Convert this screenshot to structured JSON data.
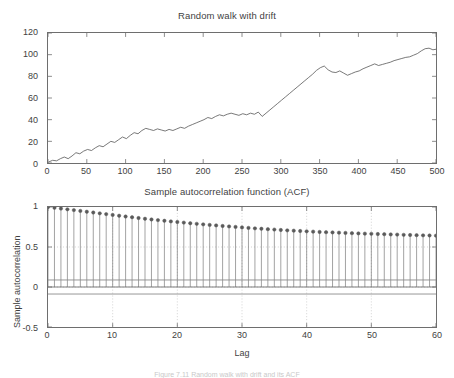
{
  "figure": {
    "caption": "Figure 7.11   Random walk with drift and its ACF"
  },
  "chart_data": [
    {
      "type": "line",
      "title": "Random walk with drift",
      "xlabel": "",
      "ylabel": "",
      "xlim": [
        0,
        500
      ],
      "ylim": [
        0,
        120
      ],
      "xticks": [
        0,
        50,
        100,
        150,
        200,
        250,
        300,
        350,
        400,
        450,
        500
      ],
      "yticks": [
        0,
        20,
        40,
        60,
        80,
        100,
        120
      ],
      "grid": false,
      "legend": null,
      "line_color": "#555555",
      "x": [
        1,
        6,
        11,
        16,
        21,
        26,
        31,
        36,
        41,
        46,
        51,
        56,
        61,
        66,
        71,
        76,
        81,
        86,
        91,
        96,
        101,
        106,
        111,
        116,
        121,
        126,
        131,
        136,
        141,
        146,
        151,
        156,
        161,
        166,
        171,
        176,
        181,
        186,
        191,
        196,
        201,
        206,
        211,
        216,
        221,
        226,
        231,
        236,
        241,
        246,
        251,
        256,
        261,
        266,
        271,
        276,
        281,
        286,
        291,
        296,
        301,
        306,
        311,
        316,
        321,
        326,
        331,
        336,
        341,
        346,
        351,
        356,
        361,
        366,
        371,
        376,
        381,
        386,
        391,
        396,
        401,
        406,
        411,
        416,
        421,
        426,
        431,
        436,
        441,
        446,
        451,
        456,
        461,
        466,
        471,
        476,
        481,
        486,
        491,
        496,
        500
      ],
      "values": [
        1.0,
        2.5,
        2.0,
        4.0,
        5.5,
        4.0,
        6.5,
        9.5,
        8.5,
        11.0,
        12.5,
        11.5,
        14.0,
        16.0,
        15.0,
        17.5,
        20.0,
        19.0,
        21.5,
        24.0,
        22.5,
        25.5,
        28.0,
        27.0,
        30.0,
        32.0,
        31.0,
        30.0,
        31.5,
        30.5,
        29.5,
        31.0,
        30.0,
        31.5,
        33.0,
        32.0,
        34.0,
        35.5,
        37.0,
        38.5,
        40.0,
        42.0,
        41.0,
        43.0,
        44.5,
        43.5,
        45.0,
        46.0,
        45.0,
        44.0,
        45.5,
        44.5,
        46.0,
        45.0,
        47.0,
        43.0,
        46.0,
        49.0,
        52.0,
        55.0,
        58.0,
        61.0,
        64.0,
        67.0,
        70.0,
        73.0,
        76.0,
        79.0,
        82.0,
        85.5,
        88.0,
        89.5,
        86.0,
        84.0,
        83.5,
        85.0,
        83.0,
        81.0,
        82.5,
        84.0,
        85.0,
        87.0,
        88.5,
        90.0,
        91.5,
        90.0,
        91.0,
        92.0,
        93.0,
        94.5,
        95.5,
        96.5,
        97.5,
        98.0,
        99.5,
        101.0,
        103.5,
        105.5,
        106.0,
        104.5,
        105.0
      ]
    },
    {
      "type": "bar",
      "subtype": "stem",
      "title": "Sample autocorrelation function (ACF)",
      "xlabel": "Lag",
      "ylabel": "Sample autocorrelation",
      "xlim": [
        0,
        60
      ],
      "ylim": [
        -0.5,
        1.0
      ],
      "xticks": [
        0,
        10,
        20,
        30,
        40,
        50,
        60
      ],
      "yticks": [
        1,
        0.5,
        0,
        -0.5
      ],
      "ytick_labels": [
        "1",
        "0.5",
        "0",
        "-0.5"
      ],
      "grid": true,
      "confidence_bounds": [
        0.0877,
        -0.0877
      ],
      "marker": "circle",
      "marker_color": "#5a5a5a",
      "categories": [
        0,
        1,
        2,
        3,
        4,
        5,
        6,
        7,
        8,
        9,
        10,
        11,
        12,
        13,
        14,
        15,
        16,
        17,
        18,
        19,
        20,
        21,
        22,
        23,
        24,
        25,
        26,
        27,
        28,
        29,
        30,
        31,
        32,
        33,
        34,
        35,
        36,
        37,
        38,
        39,
        40,
        41,
        42,
        43,
        44,
        45,
        46,
        47,
        48,
        49,
        50,
        51,
        52,
        53,
        54,
        55,
        56,
        57,
        58,
        59,
        60
      ],
      "values": [
        1.0,
        0.99,
        0.98,
        0.971,
        0.961,
        0.951,
        0.941,
        0.931,
        0.921,
        0.911,
        0.901,
        0.891,
        0.881,
        0.872,
        0.862,
        0.853,
        0.844,
        0.836,
        0.828,
        0.82,
        0.812,
        0.805,
        0.797,
        0.79,
        0.783,
        0.776,
        0.77,
        0.763,
        0.757,
        0.751,
        0.745,
        0.739,
        0.733,
        0.728,
        0.723,
        0.718,
        0.713,
        0.708,
        0.704,
        0.7,
        0.696,
        0.692,
        0.688,
        0.685,
        0.682,
        0.679,
        0.676,
        0.673,
        0.67,
        0.667,
        0.665,
        0.662,
        0.66,
        0.657,
        0.655,
        0.652,
        0.65,
        0.648,
        0.646,
        0.644,
        0.642
      ]
    }
  ]
}
